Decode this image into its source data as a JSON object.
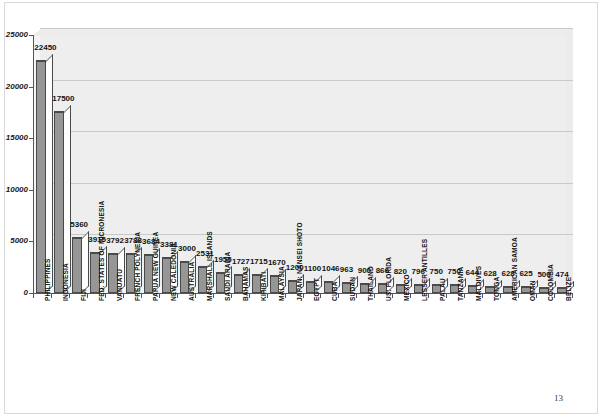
{
  "page": {
    "number": "13"
  },
  "chart_data": {
    "type": "bar",
    "title": "",
    "subtitle": "",
    "xlabel": "",
    "ylabel": "",
    "ylim": [
      0,
      25000
    ],
    "grid": true,
    "legend": "none",
    "orientation": "vertical",
    "style": "3d-column",
    "y_ticks": [
      {
        "value": 0,
        "label": "0"
      },
      {
        "value": 5000,
        "label": "5000"
      },
      {
        "value": 10000,
        "label": "10000"
      },
      {
        "value": 15000,
        "label": "15000"
      },
      {
        "value": 20000,
        "label": "20000"
      },
      {
        "value": 25000,
        "label": "25000"
      }
    ],
    "categories": [
      "PHILIPPINES",
      "INDONESIA",
      "FIJI",
      "FED. STATES OF MICRONESIA",
      "VANUATU",
      "FRENCH POLYNESIA",
      "PAPUA NEW GUINEA",
      "NEW CALEDONIA",
      "AUSTRALIA",
      "MARSHALL ISLANDS",
      "SAUDI ARABIA",
      "BAHAMAS",
      "KIRIBATI",
      "MALAYSIA",
      "JAPAN: NANSEI SHOTO",
      "EGYPT",
      "CUBA",
      "SUDAN",
      "THAILAND",
      "US: FLORIDA",
      "MEXICO",
      "LESSER ANTILLES",
      "PALAU",
      "TANZANIA",
      "MALDIVES",
      "TONGA",
      "AMERICAN SAMOA",
      "OMAN",
      "COLOMBIA",
      "BELIZE"
    ],
    "values": [
      22450,
      17500,
      5360,
      3915,
      3792,
      3788,
      3684,
      3381,
      3000,
      2531,
      1955,
      1727,
      1715,
      1670,
      1200,
      1100,
      1046,
      963,
      900,
      866,
      820,
      796,
      750,
      750,
      644,
      628,
      628,
      625,
      500,
      474
    ],
    "value_labels": [
      "22450",
      "17500",
      "5360",
      "3915",
      "3792",
      "3788",
      "3684",
      "3381",
      "3000",
      "2531",
      "1955",
      "1727",
      "1715",
      "1670",
      "1200",
      "1100",
      "1046",
      "963",
      "900",
      "866",
      "820",
      "796",
      "750",
      "750",
      "644",
      "628",
      "628",
      "625",
      "500",
      "474"
    ],
    "colors": {
      "bar_face": "#969696",
      "bar_side": "#fdfdfd",
      "bar_top": "#e2e2e2",
      "bar_outline": "#4a4a4a",
      "plot_background": "#ececec",
      "gridline": "#c9c9c9",
      "axis": "#555555",
      "text": "#111111",
      "page_background": "#ffffff"
    }
  }
}
